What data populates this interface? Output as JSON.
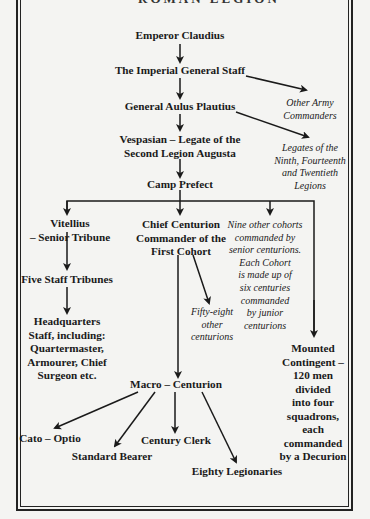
{
  "title_fragment": "ROMAN LEGION",
  "nodes": {
    "emperor": [
      "Emperor Claudius"
    ],
    "staff": [
      "The Imperial General Staff"
    ],
    "other_army": [
      "Other Army",
      "Commanders"
    ],
    "plautius": [
      "General Aulus Plautius"
    ],
    "vespasian": [
      "Vespasian – Legate of the",
      "Second Legion Augusta"
    ],
    "legates": [
      "Legates of the",
      "Ninth, Fourteenth",
      "and Twentieth",
      "Legions"
    ],
    "camp_prefect": [
      "Camp Prefect"
    ],
    "vitellius": [
      "Vitellius",
      "– Senior Tribune"
    ],
    "chief_centurion": [
      "Chief Centurion",
      "Commander of the",
      "First Cohort"
    ],
    "nine_cohorts": [
      "Nine other cohorts",
      "commanded by",
      "senior centurions.",
      "Each Cohort",
      "is made up of",
      "six centuries",
      "commanded",
      "by junior",
      "centurions"
    ],
    "five_tribunes": [
      "Five Staff Tribunes"
    ],
    "hq_staff": [
      "Headquarters",
      "Staff, including:",
      "Quartermaster,",
      "Armourer, Chief",
      "Surgeon etc."
    ],
    "fifty_eight": [
      "Fifty-eight",
      "other",
      "centurions"
    ],
    "mounted": [
      "Mounted",
      "Contingent –",
      "120 men",
      "divided",
      "into four",
      "squadrons,",
      "each",
      "commanded",
      "by a Decurion"
    ],
    "macro": [
      "Macro – Centurion"
    ],
    "cato": [
      "Cato – Optio"
    ],
    "standard_bearer": [
      "Standard Bearer"
    ],
    "century_clerk": [
      "Century Clerk"
    ],
    "eighty": [
      "Eighty Legionaries"
    ]
  },
  "colors": {
    "ink": "#1a1a1a",
    "paper": "#f4f4f2"
  }
}
